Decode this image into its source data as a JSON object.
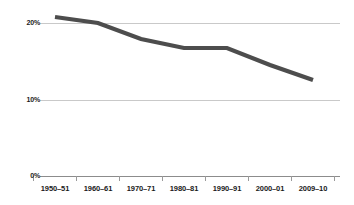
{
  "chart_data": {
    "type": "line",
    "title": "",
    "subtitle": "",
    "xlabel": "",
    "ylabel": "",
    "categories": [
      "1950–51",
      "1960–61",
      "1970–71",
      "1980–81",
      "1990–91",
      "2000–01",
      "2009–10"
    ],
    "values": [
      20.9,
      20.1,
      18.0,
      16.8,
      16.8,
      14.6,
      12.6
    ],
    "value_unit": "%",
    "ylim": [
      0,
      22
    ],
    "y_ticks": [
      0,
      10,
      20
    ],
    "y_tick_labels": [
      "0%",
      "10%",
      "20%"
    ],
    "grid": "horizontal",
    "legend": "none",
    "series": [
      {
        "name": "",
        "values": [
          20.9,
          20.1,
          18.0,
          16.8,
          16.8,
          14.6,
          12.6
        ]
      }
    ],
    "annotations": []
  },
  "style": {
    "line_color": "#4d4d4d",
    "gridline_color": "#c9c9c9",
    "axis_color": "#8c8c8c",
    "tick_color": "#9a9a9a",
    "text_color": "#1a1a1a",
    "background_color": "#ffffff",
    "line_width": 4.2
  },
  "geometry": {
    "plot_left": 40,
    "plot_right": 340,
    "plot_top": 10,
    "baseline_y": 176,
    "gridline_y_20": 23.5,
    "gridline_y_10": 100.0,
    "category_x": [
      55,
      98,
      141,
      184,
      227,
      270,
      313
    ],
    "point_y": [
      17,
      23,
      39,
      48,
      48,
      65,
      80
    ],
    "x_label_y": 184,
    "tick_length": 5
  }
}
